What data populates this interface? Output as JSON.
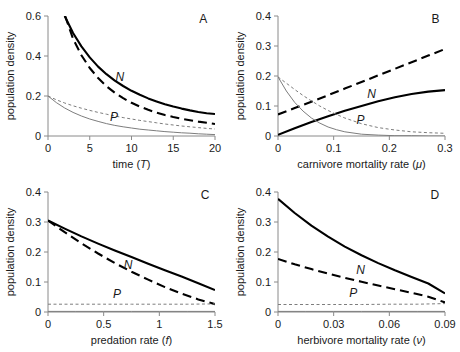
{
  "figure": {
    "title": "",
    "panel_letters": [
      "A",
      "B",
      "C",
      "D"
    ],
    "shared_ylabel": "population density",
    "curve_labels": {
      "n": "N",
      "p": "P"
    },
    "colors": {
      "thick": "#000000",
      "thin": "#7d7d7d",
      "axis": "#8a8a8a",
      "background": "#ffffff"
    }
  },
  "chart_data": [
    {
      "type": "line",
      "panel": "A",
      "title": "",
      "xlabel": "time (T)",
      "ylabel": "population density",
      "xlim": [
        0,
        20
      ],
      "ylim": [
        0,
        0.6
      ],
      "xticks": [
        0,
        5,
        10,
        15,
        20
      ],
      "xticklabels": [
        "0",
        "5",
        "10",
        "15",
        "20"
      ],
      "yticks": [
        0,
        0.2,
        0.4,
        0.6
      ],
      "yticklabels": [
        "0",
        "0.2",
        "0.4",
        "0.6"
      ],
      "grid": false,
      "legend": "inline-annotations",
      "annotations": [
        {
          "text": "N",
          "x": 8.6,
          "y": 0.275
        },
        {
          "text": "P",
          "x": 7.9,
          "y": 0.073
        },
        {
          "text": "A",
          "x": 18.6,
          "y": 0.565
        }
      ],
      "series": [
        {
          "name": "N-thick-solid",
          "style": "thick-solid",
          "x": [
            2.0,
            3,
            4,
            5,
            6,
            7,
            8,
            9,
            10,
            11,
            12,
            13,
            14,
            15,
            16,
            17,
            18,
            19,
            20
          ],
          "y": [
            0.6,
            0.515,
            0.448,
            0.393,
            0.347,
            0.309,
            0.277,
            0.25,
            0.226,
            0.206,
            0.188,
            0.173,
            0.159,
            0.147,
            0.137,
            0.128,
            0.12,
            0.114,
            0.11
          ]
        },
        {
          "name": "N-thick-dashed",
          "style": "thick-dashed",
          "x": [
            2.05,
            3,
            4,
            5,
            6,
            7,
            8,
            9,
            10,
            11,
            12,
            13,
            14,
            15,
            16,
            17,
            18,
            19,
            20
          ],
          "y": [
            0.6,
            0.486,
            0.404,
            0.34,
            0.29,
            0.249,
            0.216,
            0.189,
            0.166,
            0.147,
            0.131,
            0.117,
            0.105,
            0.095,
            0.086,
            0.079,
            0.072,
            0.066,
            0.06
          ]
        },
        {
          "name": "P-thin-dashed",
          "style": "thin-dashed",
          "x": [
            0,
            1,
            2,
            3,
            4,
            5,
            6,
            7,
            8,
            9,
            10,
            11,
            12,
            13,
            14,
            15,
            16,
            17,
            18,
            19,
            20
          ],
          "y": [
            0.2,
            0.181,
            0.165,
            0.151,
            0.139,
            0.128,
            0.118,
            0.109,
            0.1,
            0.092,
            0.085,
            0.078,
            0.072,
            0.066,
            0.06,
            0.055,
            0.05,
            0.046,
            0.042,
            0.038,
            0.035
          ]
        },
        {
          "name": "P-thin-solid",
          "style": "thin-solid",
          "x": [
            0,
            1,
            2,
            3,
            4,
            5,
            6,
            7,
            8,
            9,
            10,
            11,
            12,
            13,
            14,
            15,
            16,
            17,
            18,
            19,
            20
          ],
          "y": [
            0.2,
            0.167,
            0.14,
            0.118,
            0.1,
            0.085,
            0.073,
            0.062,
            0.053,
            0.046,
            0.04,
            0.034,
            0.03,
            0.026,
            0.022,
            0.019,
            0.016,
            0.014,
            0.011,
            0.009,
            0.007
          ]
        }
      ]
    },
    {
      "type": "line",
      "panel": "B",
      "title": "",
      "xlabel": "carnivore mortality rate (μ)",
      "ylabel": "population density",
      "xlim": [
        0,
        0.3
      ],
      "ylim": [
        0,
        0.4
      ],
      "xticks": [
        0,
        0.1,
        0.2,
        0.3
      ],
      "xticklabels": [
        "0",
        "0.1",
        "0.2",
        "0.3"
      ],
      "yticks": [
        0,
        0.1,
        0.2,
        0.3,
        0.4
      ],
      "yticklabels": [
        "0",
        "0.1",
        "0.2",
        "0.3",
        "0.4"
      ],
      "grid": false,
      "legend": "inline-annotations",
      "annotations": [
        {
          "text": "N",
          "x": 0.168,
          "y": 0.128
        },
        {
          "text": "P",
          "x": 0.148,
          "y": 0.04
        },
        {
          "text": "B",
          "x": 0.283,
          "y": 0.378
        }
      ],
      "series": [
        {
          "name": "N-thick-dashed",
          "style": "thick-dashed",
          "x": [
            0,
            0.03,
            0.06,
            0.09,
            0.12,
            0.15,
            0.18,
            0.21,
            0.24,
            0.27,
            0.3
          ],
          "y": [
            0.072,
            0.093,
            0.114,
            0.136,
            0.158,
            0.18,
            0.202,
            0.224,
            0.246,
            0.268,
            0.29
          ]
        },
        {
          "name": "N-thick-solid",
          "style": "thick-solid",
          "x": [
            0,
            0.03,
            0.06,
            0.09,
            0.12,
            0.15,
            0.18,
            0.21,
            0.24,
            0.27,
            0.3
          ],
          "y": [
            0.004,
            0.026,
            0.047,
            0.066,
            0.084,
            0.1,
            0.116,
            0.129,
            0.14,
            0.148,
            0.153
          ]
        },
        {
          "name": "P-thin-solid",
          "style": "thin-solid",
          "x": [
            0,
            0.015,
            0.03,
            0.045,
            0.06,
            0.075,
            0.09,
            0.105,
            0.12,
            0.15,
            0.18,
            0.21,
            0.24,
            0.27,
            0.3
          ],
          "y": [
            0.197,
            0.15,
            0.112,
            0.083,
            0.06,
            0.043,
            0.03,
            0.021,
            0.014,
            0.006,
            0.003,
            0.001,
            0.001,
            0.0,
            0.0
          ]
        },
        {
          "name": "P-thin-dashed",
          "style": "thin-dashed",
          "x": [
            0,
            0.015,
            0.03,
            0.045,
            0.06,
            0.075,
            0.09,
            0.105,
            0.12,
            0.15,
            0.18,
            0.21,
            0.24,
            0.27,
            0.3
          ],
          "y": [
            0.197,
            0.176,
            0.155,
            0.135,
            0.117,
            0.1,
            0.085,
            0.072,
            0.06,
            0.041,
            0.028,
            0.02,
            0.014,
            0.011,
            0.009
          ]
        }
      ]
    },
    {
      "type": "line",
      "panel": "C",
      "title": "",
      "xlabel": "predation rate (f)",
      "ylabel": "population density",
      "xlim": [
        0,
        1.5
      ],
      "ylim": [
        0,
        0.4
      ],
      "xticks": [
        0,
        0.5,
        1,
        1.5
      ],
      "xticklabels": [
        "0",
        "0.5",
        "1",
        "1.5"
      ],
      "yticks": [
        0,
        0.1,
        0.2,
        0.3,
        0.4
      ],
      "yticklabels": [
        "0",
        "0.1",
        "0.2",
        "0.3",
        "0.4"
      ],
      "grid": false,
      "legend": "inline-annotations",
      "annotations": [
        {
          "text": "N",
          "x": 0.72,
          "y": 0.143
        },
        {
          "text": "P",
          "x": 0.62,
          "y": 0.048
        },
        {
          "text": "C",
          "x": 1.41,
          "y": 0.378
        }
      ],
      "series": [
        {
          "name": "N-thick-solid",
          "style": "thick-solid",
          "x": [
            0,
            0.15,
            0.3,
            0.45,
            0.6,
            0.75,
            0.9,
            1.05,
            1.2,
            1.35,
            1.5
          ],
          "y": [
            0.305,
            0.278,
            0.252,
            0.228,
            0.205,
            0.183,
            0.161,
            0.139,
            0.118,
            0.096,
            0.073
          ]
        },
        {
          "name": "N-thick-dashed",
          "style": "thick-dashed",
          "x": [
            0,
            0.15,
            0.3,
            0.45,
            0.6,
            0.75,
            0.9,
            1.05,
            1.2,
            1.35,
            1.5
          ],
          "y": [
            0.305,
            0.266,
            0.229,
            0.195,
            0.163,
            0.134,
            0.108,
            0.083,
            0.061,
            0.042,
            0.026
          ]
        },
        {
          "name": "P-thin-dashed",
          "style": "thin-dashed",
          "x": [
            0,
            0.25,
            0.5,
            0.75,
            1.0,
            1.25,
            1.5
          ],
          "y": [
            0.026,
            0.026,
            0.026,
            0.026,
            0.026,
            0.026,
            0.027
          ]
        },
        {
          "name": "P-thin-solid",
          "style": "thin-solid",
          "x": [
            0,
            0.25,
            0.5,
            0.75,
            1.0,
            1.25,
            1.5
          ],
          "y": [
            0.002,
            0.002,
            0.002,
            0.002,
            0.002,
            0.002,
            0.002
          ]
        }
      ]
    },
    {
      "type": "line",
      "panel": "D",
      "title": "",
      "xlabel": "herbivore mortality rate (ν)",
      "ylabel": "population density",
      "xlim": [
        0,
        0.09
      ],
      "ylim": [
        0,
        0.4
      ],
      "xticks": [
        0,
        0.03,
        0.06,
        0.09
      ],
      "xticklabels": [
        "0",
        "0.03",
        "0.06",
        "0.09"
      ],
      "yticks": [
        0,
        0.1,
        0.2,
        0.3,
        0.4
      ],
      "yticklabels": [
        "0",
        "0.1",
        "0.2",
        "0.3",
        "0.4"
      ],
      "grid": false,
      "legend": "inline-annotations",
      "annotations": [
        {
          "text": "N",
          "x": 0.0445,
          "y": 0.127
        },
        {
          "text": "P",
          "x": 0.0405,
          "y": 0.05
        },
        {
          "text": "D",
          "x": 0.0845,
          "y": 0.378
        }
      ],
      "series": [
        {
          "name": "N-thick-solid",
          "style": "thick-solid",
          "x": [
            0,
            0.009,
            0.018,
            0.027,
            0.036,
            0.045,
            0.054,
            0.063,
            0.072,
            0.081,
            0.09
          ],
          "y": [
            0.377,
            0.33,
            0.288,
            0.251,
            0.218,
            0.189,
            0.163,
            0.139,
            0.117,
            0.095,
            0.062
          ]
        },
        {
          "name": "N-thick-dashed",
          "style": "thick-dashed",
          "x": [
            0,
            0.009,
            0.018,
            0.027,
            0.036,
            0.045,
            0.054,
            0.063,
            0.072,
            0.081,
            0.09
          ],
          "y": [
            0.177,
            0.159,
            0.143,
            0.128,
            0.114,
            0.101,
            0.088,
            0.076,
            0.064,
            0.051,
            0.032
          ]
        },
        {
          "name": "P-thin-dashed",
          "style": "thin-dashed",
          "x": [
            0,
            0.015,
            0.03,
            0.045,
            0.06,
            0.075,
            0.09
          ],
          "y": [
            0.025,
            0.025,
            0.025,
            0.025,
            0.026,
            0.026,
            0.028
          ]
        },
        {
          "name": "P-thin-solid",
          "style": "thin-solid",
          "x": [
            0,
            0.015,
            0.03,
            0.045,
            0.06,
            0.075,
            0.09
          ],
          "y": [
            0.002,
            0.002,
            0.002,
            0.002,
            0.002,
            0.002,
            0.002
          ]
        }
      ]
    }
  ]
}
